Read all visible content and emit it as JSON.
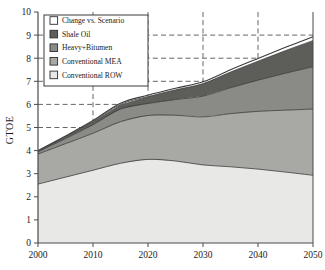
{
  "chart_data": {
    "type": "area",
    "title": "",
    "xlabel": "",
    "ylabel": "GTOE",
    "xlim": [
      2000,
      2050
    ],
    "ylim": [
      0,
      10
    ],
    "grid": true,
    "grid_y": [
      5,
      6,
      7,
      8,
      9
    ],
    "grid_x": [
      2010,
      2020,
      2030,
      2040
    ],
    "x_ticks": [
      "2000",
      "2010",
      "2020",
      "2030",
      "2040",
      "2050"
    ],
    "y_ticks": [
      "0",
      "1",
      "2",
      "3",
      "4",
      "5",
      "6",
      "7",
      "8",
      "9",
      "10"
    ],
    "x": [
      2000,
      2005,
      2010,
      2015,
      2020,
      2025,
      2030,
      2035,
      2040,
      2045,
      2050
    ],
    "stacked": true,
    "legend_position": "top-left",
    "series": [
      {
        "name": "Conventional ROW",
        "color": "#e8e8e6",
        "values": [
          2.55,
          2.85,
          3.15,
          3.45,
          3.62,
          3.55,
          3.38,
          3.3,
          3.2,
          3.07,
          2.93
        ]
      },
      {
        "name": "Conventional MEA",
        "color": "#a8a8a4",
        "values": [
          1.3,
          1.45,
          1.6,
          1.8,
          1.9,
          1.98,
          2.08,
          2.3,
          2.5,
          2.68,
          2.87
        ]
      },
      {
        "name": "Heavy+Bitumen",
        "color": "#8a8a86",
        "values": [
          0.1,
          0.22,
          0.37,
          0.55,
          0.52,
          0.68,
          0.9,
          1.12,
          1.35,
          1.6,
          1.83
        ]
      },
      {
        "name": "Shale Oil",
        "color": "#5d5d59",
        "values": [
          0.03,
          0.08,
          0.14,
          0.2,
          0.3,
          0.42,
          0.54,
          0.68,
          0.82,
          0.98,
          1.13
        ]
      },
      {
        "name": "Change vs. Scenario",
        "color": "#ffffff",
        "values": [
          0.02,
          0.03,
          0.04,
          0.05,
          0.06,
          0.07,
          0.08,
          0.1,
          0.12,
          0.14,
          0.17
        ]
      }
    ],
    "legend_order": [
      "Change vs. Scenario",
      "Shale Oil",
      "Heavy+Bitumen",
      "Conventional MEA",
      "Conventional ROW"
    ]
  },
  "legend": {
    "items": [
      {
        "label": "Change vs. Scenario",
        "color": "#ffffff"
      },
      {
        "label": "Shale Oil",
        "color": "#5d5d59"
      },
      {
        "label": "Heavy+Bitumen",
        "color": "#8a8a86"
      },
      {
        "label": "Conventional MEA",
        "color": "#a8a8a4"
      },
      {
        "label": "Conventional ROW",
        "color": "#e8e8e6"
      }
    ]
  },
  "axis": {
    "y_title": "GTOE"
  },
  "colors": {
    "axis": "#4a4a4a",
    "grid": "#555555",
    "outline": "#3a3a3a",
    "text": "#1a1a1a"
  }
}
